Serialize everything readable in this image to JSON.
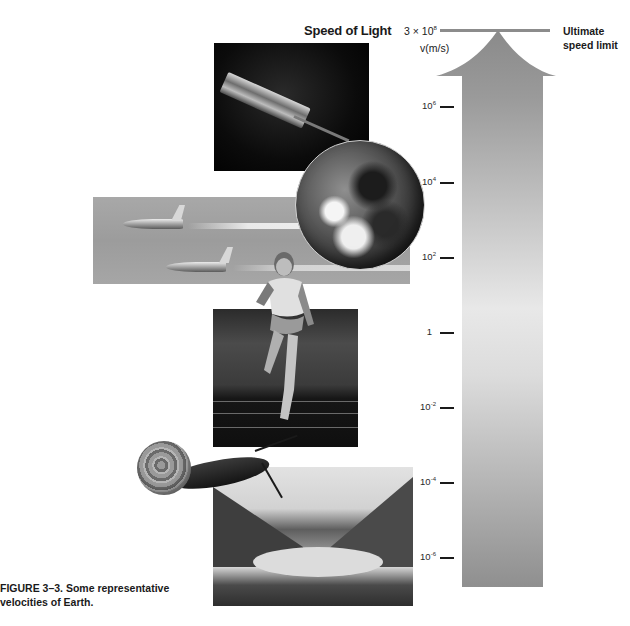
{
  "figure": {
    "title": "Speed of Light",
    "axis_unit": "v(m/s)",
    "top_value": {
      "base": "3 × 10",
      "exponent": "8"
    },
    "limit_label_line1": "Ultimate",
    "limit_label_line2": "speed limit",
    "caption_line1": "FIGURE 3–3. Some representative",
    "caption_line2": "velocities of Earth."
  },
  "axis": {
    "scale": "log",
    "ticks": [
      {
        "label_base": "10",
        "exponent": "6",
        "value": 1000000
      },
      {
        "label_base": "10",
        "exponent": "4",
        "value": 10000
      },
      {
        "label_base": "10",
        "exponent": "2",
        "value": 100
      },
      {
        "label_base": "1",
        "exponent": "",
        "value": 1
      },
      {
        "label_base": "10",
        "exponent": "-2",
        "value": 0.01
      },
      {
        "label_base": "10",
        "exponent": "-4",
        "value": 0.0001
      },
      {
        "label_base": "10",
        "exponent": "-6",
        "value": 1e-06
      }
    ],
    "max_value": 300000000
  },
  "images": [
    {
      "name": "laser",
      "description": "laser tube emitting beam"
    },
    {
      "name": "earth",
      "description": "Earth globe"
    },
    {
      "name": "jets",
      "description": "two jet aircraft with contrails"
    },
    {
      "name": "runner",
      "description": "sprinting runner"
    },
    {
      "name": "track",
      "description": "running track"
    },
    {
      "name": "snail",
      "description": "snail"
    },
    {
      "name": "glacier",
      "description": "glacier between mountains"
    }
  ],
  "colors": {
    "arrow_top": "#8a8a8a",
    "arrow_mid": "#e8e8e8",
    "arrow_bottom": "#8f8f8f",
    "limit_line": "#8c8c8c",
    "text": "#1a1a1a"
  }
}
